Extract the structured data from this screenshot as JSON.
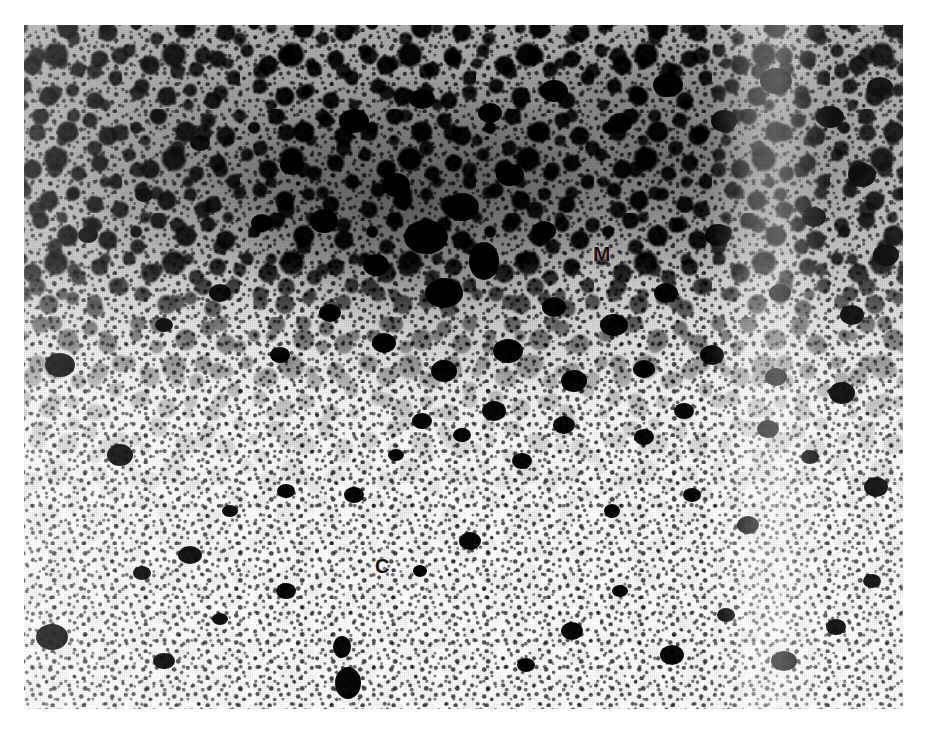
{
  "figure": {
    "kind": "histological-micrograph",
    "technique": "silver-grain autoradiography / dark immunostained section",
    "background_tone": "#e9e9e7",
    "stain_color": "#0d0d0d",
    "plate": {
      "left": 24,
      "top": 25,
      "width": 879,
      "height": 684
    },
    "labels": [
      {
        "id": "M",
        "text": "M",
        "name": "region-label-medulla",
        "x": 593,
        "y": 243,
        "font_size": 21,
        "description": "marks the dense, heavily labelled medullary region in the upper half"
      },
      {
        "id": "C",
        "text": "C",
        "name": "region-label-cortex",
        "x": 375,
        "y": 556,
        "font_size": 20,
        "description": "marks the pale, sparsely labelled cortical region in the lower half"
      }
    ],
    "regions": [
      {
        "name": "dense-band",
        "position": "upper third",
        "density": "high",
        "note": "confluent dark granular clusters"
      },
      {
        "name": "transition-band",
        "position": "middle",
        "density": "medium",
        "note": "gradual fall-off in grain density"
      },
      {
        "name": "sparse-band",
        "position": "lower third",
        "density": "low",
        "note": "isolated dark blobs on a pale ground"
      },
      {
        "name": "light-streak",
        "position": "right of centre",
        "density": "very low",
        "note": "pale vertical band running down the right side of the dense region"
      }
    ]
  }
}
